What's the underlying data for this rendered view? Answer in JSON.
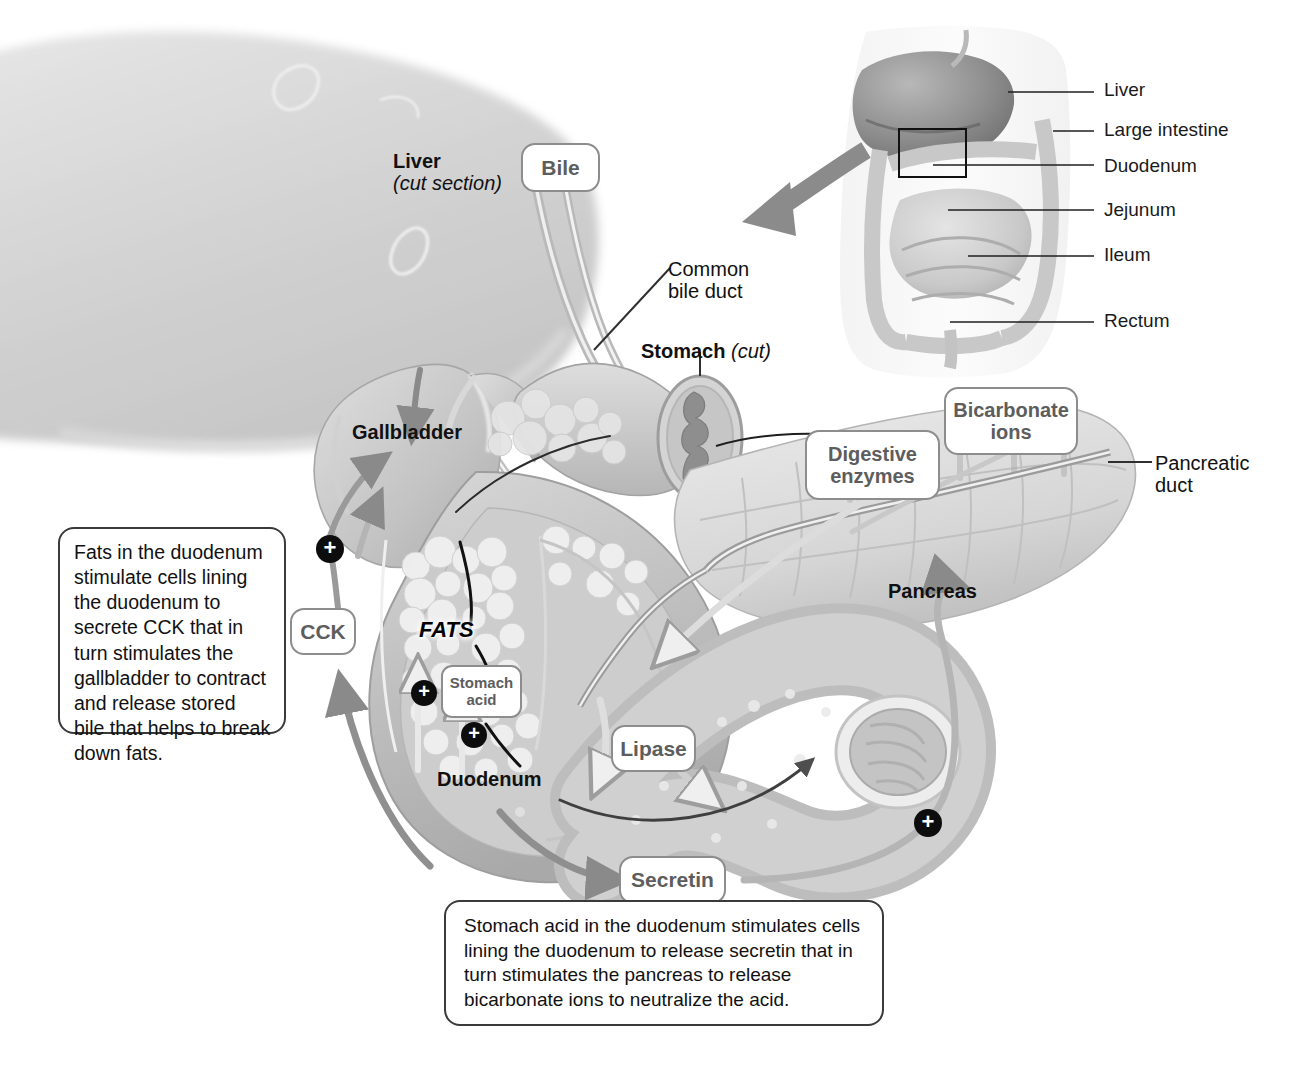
{
  "inset": {
    "labels": [
      {
        "id": "liver",
        "text": "Liver"
      },
      {
        "id": "large-intestine",
        "text": "Large intestine"
      },
      {
        "id": "duodenum",
        "text": "Duodenum"
      },
      {
        "id": "jejunum",
        "text": "Jejunum"
      },
      {
        "id": "ileum",
        "text": "Ileum"
      },
      {
        "id": "rectum",
        "text": "Rectum"
      }
    ]
  },
  "anatomy_labels": {
    "liver": "Liver",
    "liver_sub": "(cut section)",
    "common_bile_duct_line1": "Common",
    "common_bile_duct_line2": "bile duct",
    "stomach": "Stomach",
    "stomach_sub": "(cut)",
    "gallbladder": "Gallbladder",
    "fats": "FATS",
    "duodenum": "Duodenum",
    "pancreas": "Pancreas",
    "pancreatic_duct_line1": "Pancreatic",
    "pancreatic_duct_line2": "duct"
  },
  "callouts": {
    "bile": "Bile",
    "cck": "CCK",
    "stomach_acid_line1": "Stomach",
    "stomach_acid_line2": "acid",
    "digestive_enzymes_line1": "Digestive",
    "digestive_enzymes_line2": "enzymes",
    "bicarbonate_line1": "Bicarbonate",
    "bicarbonate_line2": "ions",
    "lipase": "Lipase",
    "secretin": "Secretin"
  },
  "explanations": {
    "cck_box": "Fats in the duodenum stimulate cells lining the duodenum to secrete CCK that in turn stimulates the gallbladder to contract and release stored bile that helps to break down fats.",
    "secretin_box": "Stomach acid in the duodenum stimulates cells lining the duodenum to release secretin that in turn stimulates the pancreas to release bicarbonate ions to neutralize the acid."
  },
  "badges": {
    "plus": "+",
    "count": 4
  },
  "colors": {
    "callout_border": "#8d8d8d",
    "callout_text": "#5d5d5d",
    "textbox_border": "#3a3a3a",
    "label_text": "#111111",
    "arrow_gray": "#8a8a8a",
    "arrow_dark": "#4a4a4a",
    "organ_light": "#dcdcdc",
    "organ_mid": "#bfbfbf",
    "organ_dark": "#9a9a9a",
    "badge_bg": "#0d0d0d",
    "page_bg": "#ffffff"
  }
}
